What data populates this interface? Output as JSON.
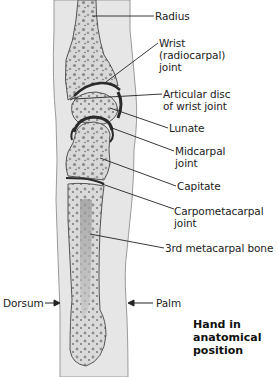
{
  "figure": {
    "title_lines": [
      "Hand in",
      "anatomical",
      "position"
    ],
    "labels": {
      "radius": "Radius",
      "wrist_joint": [
        "Wrist",
        "(radiocarpal)",
        "joint"
      ],
      "articular_disc": [
        "Articular disc",
        "of wrist joint"
      ],
      "lunate": "Lunate",
      "midcarpal_joint": [
        "Midcarpal",
        "joint"
      ],
      "capitate": "Capitate",
      "carpometacarpal_joint": [
        "Carpometacarpal",
        "joint"
      ],
      "third_metacarpal": "3rd metacarpal bone",
      "dorsum": "Dorsum",
      "palm": "Palm"
    },
    "colors": {
      "skin": "#e4e4e4",
      "skin_edge": "#9a9a9a",
      "bone": "#dcdcdc",
      "bone_edge": "#555555",
      "cartilage": "#2a2a2a",
      "trabecula": "#7a7a7a",
      "leader": "#222222"
    }
  }
}
